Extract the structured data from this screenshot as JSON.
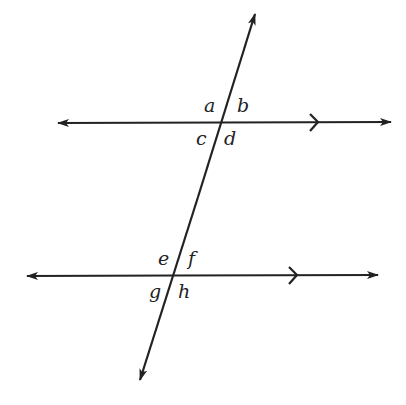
{
  "diagram": {
    "type": "parallel lines cut by a transversal",
    "colors": {
      "stroke": "#222222",
      "background": "#ffffff"
    },
    "lines": [
      {
        "id": "top-parallel",
        "x1": 58,
        "y1": 123,
        "x2": 391,
        "y2": 122,
        "parallel_mark_x": 314
      },
      {
        "id": "bottom-parallel",
        "x1": 27,
        "y1": 276,
        "x2": 378,
        "y2": 275,
        "parallel_mark_x": 293
      },
      {
        "id": "transversal",
        "x1": 255,
        "y1": 14,
        "x2": 140,
        "y2": 380
      }
    ],
    "angles": {
      "top": {
        "a": "a",
        "b": "b",
        "c": "c",
        "d": "d"
      },
      "bottom": {
        "e": "e",
        "f": "f",
        "g": "g",
        "h": "h"
      }
    }
  }
}
